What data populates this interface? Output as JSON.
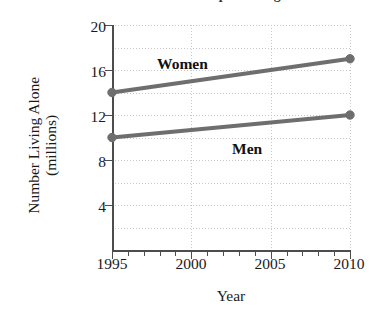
{
  "chart_data": {
    "type": "line",
    "title": "Number of People Living Alone",
    "xlabel": "Year",
    "ylabel": "Number Living Alone (millions)",
    "ylabel_line1": "Number Living Alone",
    "ylabel_line2": "(millions)",
    "x": [
      1995,
      2010
    ],
    "xlim": [
      1995,
      2010
    ],
    "ylim": [
      0,
      20
    ],
    "xticks": [
      1995,
      2000,
      2005,
      2010
    ],
    "xtick_labels": [
      "1995",
      "2000",
      "2005",
      "2010"
    ],
    "yticks": [
      4,
      8,
      12,
      16,
      20
    ],
    "ytick_labels": [
      "4",
      "8",
      "12",
      "16",
      "20"
    ],
    "x_minor_tick_step": 1,
    "y_minor_gridline_step": 2,
    "grid": true,
    "grid_style": "dotted",
    "grid_color": "#c9c9c9",
    "legend": "inline-annotations",
    "series": [
      {
        "name": "Women",
        "values": [
          14,
          17
        ],
        "color": "#6e6e6e",
        "marker": "circle",
        "label_x": 2000.2,
        "label_y": 18.0
      },
      {
        "name": "Men",
        "values": [
          10,
          12
        ],
        "color": "#6e6e6e",
        "marker": "circle",
        "label_x": 2003.8,
        "label_y": 10.1
      }
    ],
    "annotations": [
      {
        "text": "Women",
        "series": "Women"
      },
      {
        "text": "Men",
        "series": "Men"
      }
    ],
    "axis_color": "#4d4d4d",
    "series_color": "#6e6e6e"
  },
  "ytick_labels": {
    "t20": "20",
    "t16": "16",
    "t12": "12",
    "t8": "8",
    "t4": "4"
  },
  "xtick_labels": {
    "t1995": "1995",
    "t2000": "2000",
    "t2005": "2005",
    "t2010": "2010"
  },
  "labels": {
    "women": "Women",
    "men": "Men",
    "y_title_line1": "Number Living Alone",
    "y_title_line2": "(millions)",
    "x_title": "Year",
    "chart_title": "Number of People Living Alone"
  }
}
